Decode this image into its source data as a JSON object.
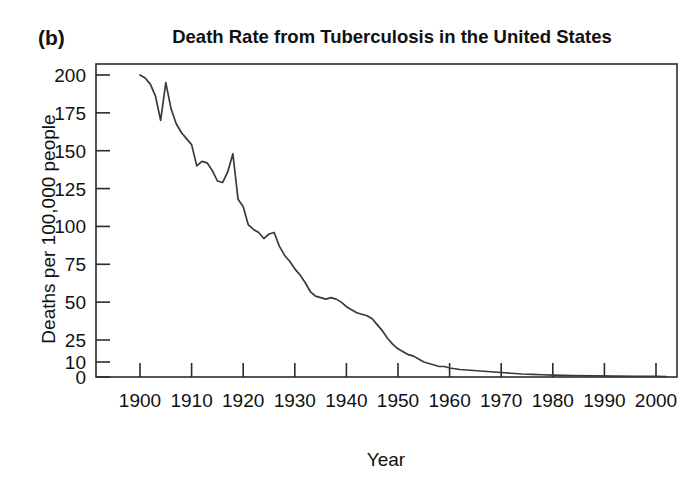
{
  "panel_label": "(b)",
  "axis_titles": {
    "x": "Year",
    "y": "Deaths per 100,000 people"
  },
  "chart_data": {
    "type": "line",
    "title": "Death Rate from Tuberculosis in the United States",
    "xlabel": "Year",
    "ylabel": "Deaths per 100,000 people",
    "xlim": [
      1896,
      2003
    ],
    "ylim": [
      0,
      205
    ],
    "grid": false,
    "legend": null,
    "line_color": "#3a3a3a",
    "xticks": [
      1900,
      1910,
      1920,
      1930,
      1940,
      1950,
      1960,
      1970,
      1980,
      1990,
      2000
    ],
    "xtick_labels": [
      "1900",
      "1910",
      "1920",
      "1930",
      "1940",
      "1950",
      "1960",
      "1970",
      "1980",
      "1990",
      "2000"
    ],
    "yticks": [
      0,
      10,
      25,
      50,
      75,
      100,
      125,
      150,
      175,
      200
    ],
    "ytick_labels": [
      "0",
      "10",
      "25",
      "50",
      "75",
      "100",
      "125",
      "150",
      "175",
      "200"
    ],
    "y_scale_note": "non-linear below 25: ticks 0, 10, 25 are compressed",
    "series": [
      {
        "name": "Death rate from tuberculosis",
        "x": [
          1900,
          1901,
          1902,
          1903,
          1904,
          1905,
          1906,
          1907,
          1908,
          1909,
          1910,
          1911,
          1912,
          1913,
          1914,
          1915,
          1916,
          1917,
          1918,
          1919,
          1920,
          1921,
          1922,
          1923,
          1924,
          1925,
          1926,
          1927,
          1928,
          1929,
          1930,
          1931,
          1932,
          1933,
          1934,
          1935,
          1936,
          1937,
          1938,
          1939,
          1940,
          1941,
          1942,
          1943,
          1944,
          1945,
          1946,
          1947,
          1948,
          1949,
          1950,
          1951,
          1952,
          1953,
          1954,
          1955,
          1956,
          1957,
          1958,
          1959,
          1960,
          1962,
          1964,
          1966,
          1968,
          1970,
          1972,
          1974,
          1976,
          1978,
          1980,
          1984,
          1988,
          1992,
          1996,
          2000,
          2002
        ],
        "y": [
          200,
          198,
          194,
          186,
          170,
          195,
          178,
          168,
          162,
          158,
          154,
          140,
          143,
          142,
          137,
          130,
          129,
          136,
          148,
          118,
          113,
          101,
          98,
          96,
          92,
          95,
          96,
          87,
          81,
          77,
          72,
          68,
          63,
          57,
          54,
          53,
          52,
          53,
          52,
          50,
          47,
          45,
          43,
          42,
          41,
          39,
          35,
          31,
          26,
          22,
          19,
          17,
          15,
          14,
          12,
          10,
          9,
          8,
          7,
          7,
          6,
          5,
          4.5,
          4,
          3.5,
          3,
          2.5,
          2,
          1.8,
          1.5,
          1.3,
          1,
          0.8,
          0.6,
          0.5,
          0.4,
          0.3
        ]
      }
    ]
  }
}
